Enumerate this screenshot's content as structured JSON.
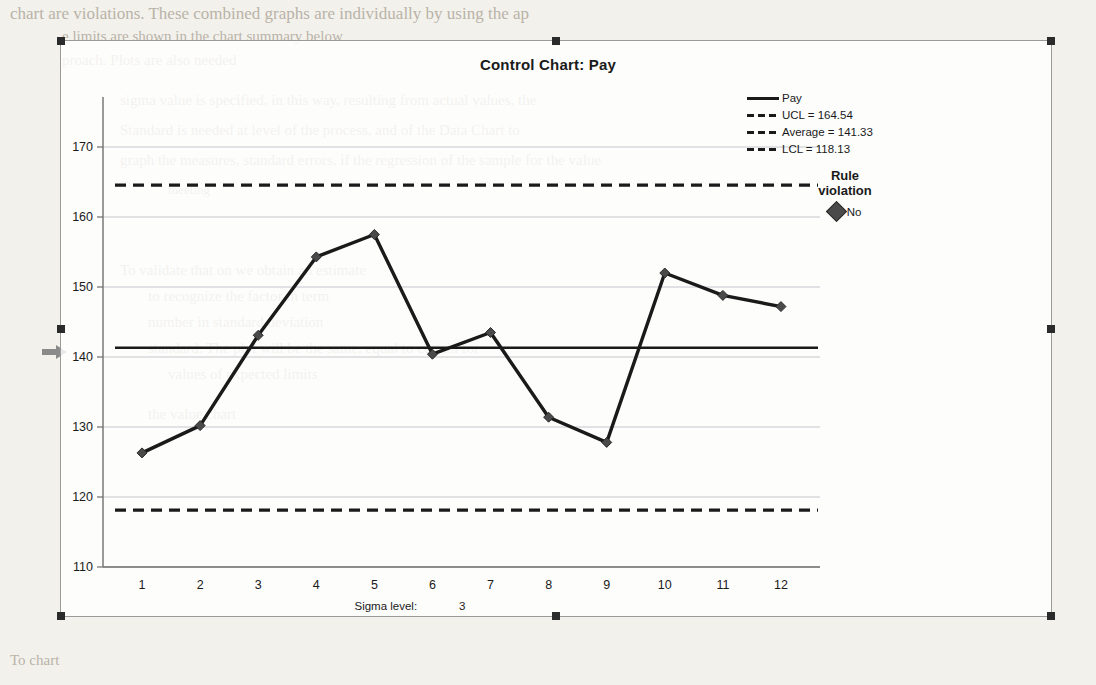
{
  "chart_data": {
    "type": "line",
    "title": "Control Chart: Pay",
    "xlabel": "",
    "ylabel": "",
    "x": [
      1,
      2,
      3,
      4,
      5,
      6,
      7,
      8,
      9,
      10,
      11,
      12
    ],
    "categories": [
      "1",
      "2",
      "3",
      "4",
      "5",
      "6",
      "7",
      "8",
      "9",
      "10",
      "11",
      "12"
    ],
    "series": [
      {
        "name": "Pay",
        "values": [
          126.3,
          130.2,
          143.1,
          154.3,
          157.5,
          140.4,
          143.5,
          131.4,
          127.8,
          152.0,
          148.8,
          147.2
        ]
      }
    ],
    "ylim": [
      110,
      170
    ],
    "yticks": [
      110,
      120,
      130,
      140,
      150,
      160,
      170
    ],
    "xticks": [
      "1",
      "2",
      "3",
      "4",
      "5",
      "6",
      "7",
      "8",
      "9",
      "10",
      "11",
      "12"
    ],
    "grid": true,
    "legend_position": "right",
    "control_limits": {
      "ucl": 164.54,
      "average": 141.33,
      "lcl": 118.13
    },
    "marker": "diamond",
    "line_color": "#1a1a1a"
  },
  "chart": {
    "title": "Control Chart: Pay",
    "y_tick_labels": [
      "170",
      "160",
      "150",
      "140",
      "130",
      "120",
      "110"
    ],
    "x_tick_labels": [
      "1",
      "2",
      "3",
      "4",
      "5",
      "6",
      "7",
      "8",
      "9",
      "10",
      "11",
      "12"
    ]
  },
  "legend": {
    "items": [
      {
        "label": "Pay",
        "key": "solid"
      },
      {
        "label": "UCL = 164.54",
        "key": "dashed"
      },
      {
        "label": "Average = 141.33",
        "key": "dashed"
      },
      {
        "label": "LCL = 118.13",
        "key": "dashed"
      }
    ]
  },
  "rule_violation": {
    "title_line1": "Rule",
    "title_line2": "violation",
    "value": "No"
  },
  "footer": {
    "sigma_label": "Sigma level:",
    "sigma_value": "3"
  },
  "background_text": {
    "line1": "chart are violations. These combined graphs are individually by using the ap",
    "line2": "e limits are shown in the chart summary below",
    "line3": "proach. Plots are also needed",
    "line4": "sigma value is specified, in this way, resulting from actual values, the",
    "line5": "Standard is needed at level of the process, and of the Data Chart to",
    "line6": "graph the measures, standard errors, if the regression of the sample for the value",
    "line7": "meeting",
    "line8": "To validate that on we obtain an estimate",
    "line9": "to recognize the factor in term",
    "line10": "number in standard deviation",
    "line11": "standard. The plot will be the same, equal to certain for",
    "line12": "values of expected limits",
    "line13": "the value chart",
    "line14": "To chart"
  }
}
